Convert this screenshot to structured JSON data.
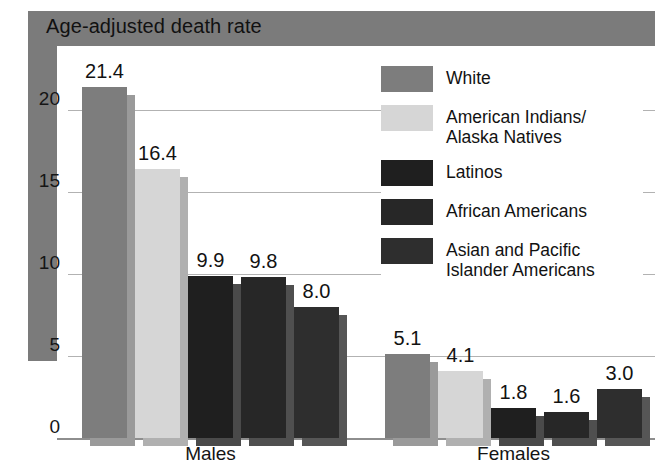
{
  "title": "Age-adjusted death rate",
  "colors": {
    "frame": "#7b7b7b",
    "gridline": "#b2b2b2",
    "baseline": "#8e8e8e",
    "series": [
      "#7d7d7d",
      "#d6d6d6",
      "#1f1f1f",
      "#272727",
      "#2e2e2e"
    ],
    "shadows": [
      "#9a9a9a",
      "#b0b0b0",
      "#4a4a4a",
      "#4f4f4f",
      "#565656"
    ]
  },
  "legend": [
    {
      "label": "White",
      "color": "#7d7d7d"
    },
    {
      "label": "American Indians/\nAlaska Natives",
      "color": "#d6d6d6"
    },
    {
      "label": "Latinos",
      "color": "#1f1f1f"
    },
    {
      "label": "African Americans",
      "color": "#272727"
    },
    {
      "label": "Asian and Pacific\nIslander Americans",
      "color": "#2e2e2e"
    }
  ],
  "chart_data": {
    "type": "bar",
    "title": "Age-adjusted death rate",
    "xlabel": "",
    "ylabel": "",
    "ylim": [
      0,
      22
    ],
    "yticks": [
      "0",
      "5",
      "10",
      "15",
      "20"
    ],
    "ytick_values": [
      0,
      5,
      10,
      15,
      20
    ],
    "grid": true,
    "legend_position": "center",
    "categories": [
      "Males",
      "Females"
    ],
    "series": [
      {
        "name": "White",
        "values": [
          21.4,
          5.1
        ],
        "labels": [
          "21.4",
          "5.1"
        ]
      },
      {
        "name": "American Indians/Alaska Natives",
        "values": [
          16.4,
          4.1
        ],
        "labels": [
          "16.4",
          "4.1"
        ]
      },
      {
        "name": "Latinos",
        "values": [
          9.9,
          1.8
        ],
        "labels": [
          "9.9",
          "1.8"
        ]
      },
      {
        "name": "African Americans",
        "values": [
          9.8,
          1.6
        ],
        "labels": [
          "9.8",
          "1.6"
        ]
      },
      {
        "name": "Asian and Pacific Islander Americans",
        "values": [
          8.0,
          3.0
        ],
        "labels": [
          "8.0",
          "3.0"
        ]
      }
    ]
  }
}
